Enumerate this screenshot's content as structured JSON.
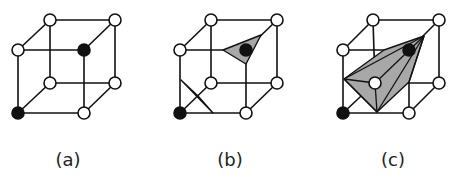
{
  "figure": {
    "panels": [
      {
        "id": "a",
        "label": "(a)",
        "black_vertices": [
          "front-bottom-left",
          "front-top-right"
        ],
        "shaded_regions": 0
      },
      {
        "id": "b",
        "label": "(b)",
        "black_vertices": [
          "front-bottom-left",
          "front-top-right"
        ],
        "shaded_regions": 2
      },
      {
        "id": "c",
        "label": "(c)",
        "black_vertices": [
          "front-bottom-left",
          "front-top-right"
        ],
        "shaded_regions": 1
      }
    ],
    "colors": {
      "edge": "#111111",
      "shade": "#a8a8a8",
      "vertex_filled": "#111111",
      "vertex_empty": "#ffffff"
    }
  }
}
